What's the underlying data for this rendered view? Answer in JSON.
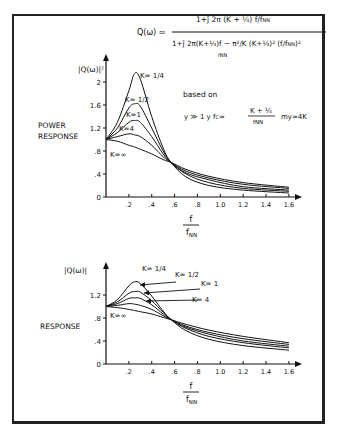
{
  "formula": {
    "lhs": "Q(ω) ≈",
    "numerator": "1+j 2π (K + 1/4) f/fNN",
    "denominator": "1+j 2π (K+1/4) f/fNN − π²/K (K+1/4)² (f/fNN)²"
  },
  "note": {
    "line1": "based on",
    "line2": "y ≫ 1   y fC ≈ (K + 1/4)/fNN   my ≈ 4K"
  },
  "chart_data": [
    {
      "type": "line",
      "title": "POWER RESPONSE",
      "ylabel": "|Q(ω)|²",
      "xlabel": "f / fNN",
      "yticks": [
        "0",
        ".4",
        ".8",
        "1.2",
        "1.6",
        "2"
      ],
      "xticks": [
        ".2",
        ".4",
        ".6",
        ".8",
        "1.0",
        "1.2",
        "1.4",
        "1.6"
      ],
      "ylim": [
        0,
        2.2
      ],
      "xlim": [
        0,
        1.6
      ],
      "grid": false,
      "x": [
        0,
        0.1,
        0.2,
        0.25,
        0.3,
        0.4,
        0.5,
        0.57,
        0.7,
        0.9,
        1.2,
        1.6
      ],
      "series": [
        {
          "name": "K=1/4",
          "values": [
            1.0,
            1.3,
            1.85,
            2.15,
            2.05,
            1.4,
            0.85,
            0.6,
            0.35,
            0.2,
            0.12,
            0.07
          ]
        },
        {
          "name": "K=1/2",
          "values": [
            1.0,
            1.2,
            1.55,
            1.62,
            1.58,
            1.2,
            0.8,
            0.6,
            0.4,
            0.25,
            0.15,
            0.1
          ]
        },
        {
          "name": "K=1",
          "values": [
            1.0,
            1.12,
            1.3,
            1.33,
            1.3,
            1.05,
            0.75,
            0.6,
            0.42,
            0.3,
            0.18,
            0.12
          ]
        },
        {
          "name": "K=4",
          "values": [
            1.0,
            1.05,
            1.1,
            1.08,
            1.05,
            0.9,
            0.7,
            0.6,
            0.45,
            0.33,
            0.22,
            0.15
          ]
        },
        {
          "name": "K=∞",
          "values": [
            1.0,
            0.97,
            0.9,
            0.87,
            0.83,
            0.75,
            0.65,
            0.6,
            0.48,
            0.36,
            0.25,
            0.17
          ]
        }
      ],
      "labels": [
        "K=1/4",
        "K=1/2",
        "K=1",
        "K=4",
        "K=∞"
      ]
    },
    {
      "type": "line",
      "title": "RESPONSE",
      "ylabel": "|Q(ω)|",
      "xlabel": "f / fNN",
      "yticks": [
        "0",
        ".4",
        ".8",
        "1.2"
      ],
      "xticks": [
        ".2",
        ".4",
        ".6",
        ".8",
        "1.0",
        "1.2",
        "1.4",
        "1.6"
      ],
      "ylim": [
        0,
        1.5
      ],
      "xlim": [
        0,
        1.6
      ],
      "grid": false,
      "x": [
        0,
        0.1,
        0.2,
        0.25,
        0.3,
        0.4,
        0.5,
        0.57,
        0.7,
        0.9,
        1.2,
        1.6
      ],
      "series": [
        {
          "name": "K=1/4",
          "values": [
            1.0,
            1.12,
            1.36,
            1.43,
            1.4,
            1.18,
            0.92,
            0.77,
            0.58,
            0.43,
            0.32,
            0.24
          ]
        },
        {
          "name": "K=1/2",
          "values": [
            1.0,
            1.08,
            1.23,
            1.26,
            1.25,
            1.1,
            0.9,
            0.77,
            0.62,
            0.48,
            0.37,
            0.28
          ]
        },
        {
          "name": "K=1",
          "values": [
            1.0,
            1.05,
            1.14,
            1.15,
            1.14,
            1.03,
            0.87,
            0.77,
            0.64,
            0.52,
            0.4,
            0.31
          ]
        },
        {
          "name": "K=4",
          "values": [
            1.0,
            1.02,
            1.05,
            1.04,
            1.02,
            0.95,
            0.84,
            0.77,
            0.66,
            0.55,
            0.44,
            0.34
          ]
        },
        {
          "name": "K=∞",
          "values": [
            1.0,
            0.98,
            0.95,
            0.93,
            0.91,
            0.87,
            0.81,
            0.77,
            0.69,
            0.59,
            0.48,
            0.37
          ]
        }
      ],
      "labels": [
        "K=1/4",
        "K=1/2",
        "K=1",
        "K=4",
        "K=∞"
      ]
    }
  ],
  "top": {
    "ylabel": "|Q(ω)|²",
    "title1": "POWER",
    "title2": "RESPONSE",
    "klabels": {
      "q": "K= 1/4",
      "h": "K= 1/2",
      "one": "K=1",
      "four": "K=4",
      "inf": "K=∞"
    }
  },
  "bottom": {
    "ylabel": "|Q(ω)|",
    "title": "RESPONSE",
    "klabels": {
      "q": "K= 1/4",
      "h": "K= 1/2",
      "one": "K= 1",
      "four": "K= 4",
      "inf": "K=∞"
    }
  },
  "xaxis": {
    "num": "f",
    "den": "fNN"
  }
}
